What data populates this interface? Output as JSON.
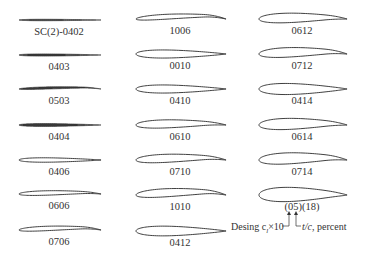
{
  "diagram": {
    "title": "",
    "columns": [
      {
        "airfoils": [
          {
            "label": "SC(2)-0402",
            "camber": 0.0,
            "thickness": 0.02,
            "y": 20
          },
          {
            "label": "0403",
            "camber": 0.0,
            "thickness": 0.03,
            "y": 55
          },
          {
            "label": "0503",
            "camber": 0.02,
            "thickness": 0.03,
            "y": 89
          },
          {
            "label": "0404",
            "camber": 0.0,
            "thickness": 0.04,
            "y": 125
          },
          {
            "label": "0406",
            "camber": 0.0,
            "thickness": 0.06,
            "y": 160
          },
          {
            "label": "0606",
            "camber": 0.02,
            "thickness": 0.06,
            "y": 194
          },
          {
            "label": "0706",
            "camber": 0.03,
            "thickness": 0.06,
            "y": 230
          }
        ]
      },
      {
        "airfoils": [
          {
            "label": "1006",
            "camber": 0.04,
            "thickness": 0.06,
            "y": 19
          },
          {
            "label": "0010",
            "camber": 0.0,
            "thickness": 0.1,
            "y": 54
          },
          {
            "label": "0410",
            "camber": 0.0,
            "thickness": 0.1,
            "y": 89
          },
          {
            "label": "0610",
            "camber": 0.02,
            "thickness": 0.1,
            "y": 125
          },
          {
            "label": "0710",
            "camber": 0.03,
            "thickness": 0.1,
            "y": 160
          },
          {
            "label": "1010",
            "camber": 0.04,
            "thickness": 0.1,
            "y": 195
          },
          {
            "label": "0412",
            "camber": 0.0,
            "thickness": 0.12,
            "y": 231
          }
        ]
      },
      {
        "airfoils": [
          {
            "label": "0612",
            "camber": 0.02,
            "thickness": 0.12,
            "y": 19
          },
          {
            "label": "0712",
            "camber": 0.03,
            "thickness": 0.12,
            "y": 54
          },
          {
            "label": "0414",
            "camber": 0.0,
            "thickness": 0.14,
            "y": 89
          },
          {
            "label": "0614",
            "camber": 0.02,
            "thickness": 0.14,
            "y": 125
          },
          {
            "label": "0714",
            "camber": 0.03,
            "thickness": 0.14,
            "y": 160
          },
          {
            "label": "(05)(18)",
            "camber": 0.01,
            "thickness": 0.18,
            "y": 195
          }
        ]
      }
    ],
    "annotation": {
      "left_text": "Desing c",
      "left_sub": "l",
      "left_suffix": "×10",
      "right_text_italic": "t/c",
      "right_suffix": ", percent"
    },
    "colors": {
      "stroke": "#2a2a2a",
      "text": "#333333"
    }
  }
}
